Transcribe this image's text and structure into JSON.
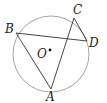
{
  "diagram": {
    "type": "circle-geometry",
    "circle": {
      "center_label": "O",
      "cx": 51,
      "cy": 54,
      "r": 38,
      "stroke": "#888888"
    },
    "points": [
      {
        "label": "A",
        "x": 51,
        "y": 89
      },
      {
        "label": "B",
        "x": 16,
        "y": 33
      },
      {
        "label": "C",
        "x": 74,
        "y": 18
      },
      {
        "label": "D",
        "x": 87,
        "y": 41
      }
    ],
    "segments": [
      [
        "B",
        "D"
      ],
      [
        "B",
        "A"
      ],
      [
        "A",
        "C"
      ],
      [
        "C",
        "D"
      ]
    ],
    "labels": {
      "A": "A",
      "B": "B",
      "C": "C",
      "D": "D",
      "O": "O"
    }
  }
}
